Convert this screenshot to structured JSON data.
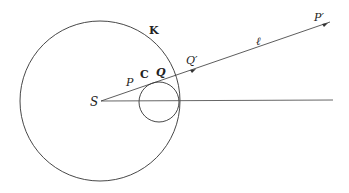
{
  "diagram": {
    "labels": {
      "big_circle": "K",
      "small_circle": "C",
      "center": "S",
      "point_p": "P",
      "point_q": "Q",
      "point_q_prime": "Q′",
      "point_p_prime": "P′",
      "ray": "ℓ"
    },
    "geometry": {
      "big_circle": {
        "cx": 100,
        "cy": 101,
        "r": 80
      },
      "small_circle": {
        "cx": 159,
        "cy": 102,
        "r": 20
      },
      "ray_end": {
        "x": 330,
        "y": 22
      },
      "horizontal_end": {
        "x": 333,
        "y": 100
      }
    },
    "colors": {
      "stroke": "#333333",
      "background": "#ffffff"
    }
  }
}
